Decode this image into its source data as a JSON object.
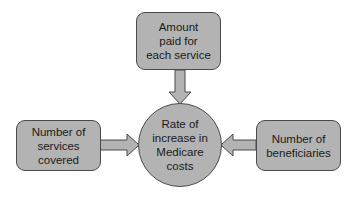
{
  "diagram": {
    "type": "influence-diagram",
    "center_node": {
      "label": "Rate of\nincrease in\nMedicare\ncosts"
    },
    "input_nodes": [
      {
        "id": "top",
        "label": "Amount\npaid for\neach service"
      },
      {
        "id": "left",
        "label": "Number of\nservices\ncovered"
      },
      {
        "id": "right",
        "label": "Number of\nbeneficiaries"
      }
    ],
    "edges": [
      {
        "from": "Amount paid for each service",
        "to": "Rate of increase in Medicare costs"
      },
      {
        "from": "Number of services covered",
        "to": "Rate of increase in Medicare costs"
      },
      {
        "from": "Number of beneficiaries",
        "to": "Rate of increase in Medicare costs"
      }
    ],
    "colors": {
      "node_fill": "#b3b3b3",
      "node_border": "#4a4a4a",
      "arrow_fill": "#b3b3b3",
      "text": "#1a1a1a"
    }
  }
}
